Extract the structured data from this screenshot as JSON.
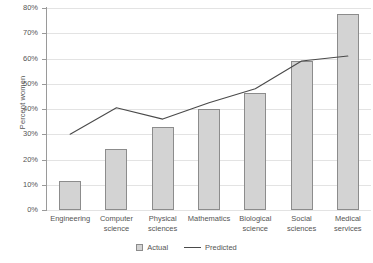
{
  "chart_data": {
    "type": "bar",
    "title": "",
    "xlabel": "",
    "ylabel": "Percent women",
    "ylim": [
      0,
      80
    ],
    "ytick_labels": [
      "0%",
      "10%",
      "20%",
      "30%",
      "40%",
      "50%",
      "60%",
      "70%",
      "80%"
    ],
    "ytick_values": [
      0,
      10,
      20,
      30,
      40,
      50,
      60,
      70,
      80
    ],
    "grid": true,
    "legend_position": "bottom",
    "categories": [
      "Engineering",
      "Computer science",
      "Physical sciences",
      "Mathematics",
      "Biological science",
      "Social sciences",
      "Medical services"
    ],
    "category_lines": [
      [
        "Engineering"
      ],
      [
        "Computer",
        "science"
      ],
      [
        "Physical",
        "sciences"
      ],
      [
        "Mathematics"
      ],
      [
        "Biological",
        "science"
      ],
      [
        "Social",
        "sciences"
      ],
      [
        "Medical",
        "services"
      ]
    ],
    "series": [
      {
        "name": "Actual",
        "type": "bar",
        "values": [
          11.5,
          24.0,
          33.0,
          40.0,
          46.5,
          59.0,
          77.5
        ]
      },
      {
        "name": "Predicted",
        "type": "line",
        "values": [
          30.0,
          40.5,
          36.0,
          42.5,
          48.0,
          59.0,
          61.0
        ]
      }
    ],
    "colors": {
      "bar_fill": "#d3d3d3",
      "bar_border": "#8c8c8c",
      "line": "#4a4a4a",
      "gridline": "#e3e3e3",
      "axis": "#9a9a9a",
      "text": "#555555"
    }
  },
  "legend": {
    "actual_label": "Actual",
    "predicted_label": "Predicted"
  }
}
